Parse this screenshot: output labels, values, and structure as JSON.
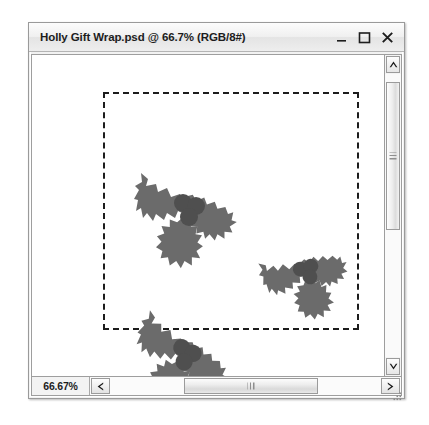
{
  "window": {
    "title": "Holly Gift Wrap.psd @ 66.7% (RGB/8#)",
    "controls": {
      "minimize_label": "Minimize",
      "maximize_label": "Maximize",
      "close_label": "Close"
    }
  },
  "statusbar": {
    "zoom_level": "66.67%",
    "scroll_left_label": "Scroll left",
    "scroll_right_label": "Scroll right"
  },
  "scrollbars": {
    "vertical": {
      "up_label": "Scroll up",
      "down_label": "Scroll down",
      "thumb_top_pct": 3,
      "thumb_height_pct": 52
    },
    "horizontal": {
      "thumb_left_pct": 27,
      "thumb_width_pct": 50
    }
  },
  "canvas": {
    "background_color": "#ffffff",
    "selection": {
      "type": "rectangular-marquee",
      "border_style": "dashed",
      "border_color": "#1c1c1c",
      "x": 71,
      "y": 37,
      "width": 256,
      "height": 238
    },
    "artwork_color": "#6b6b6b",
    "berry_color": "#4f4f4f",
    "objects": [
      {
        "name": "holly-sprig-top-left",
        "x": 28,
        "y": 10,
        "scale": 1.0,
        "rotation": 0
      },
      {
        "name": "holly-sprig-center",
        "x": 152,
        "y": 105,
        "scale": 0.82,
        "rotation": -28
      },
      {
        "name": "holly-sprig-bottom-left",
        "x": 22,
        "y": 158,
        "scale": 0.95,
        "rotation": 14
      }
    ]
  }
}
